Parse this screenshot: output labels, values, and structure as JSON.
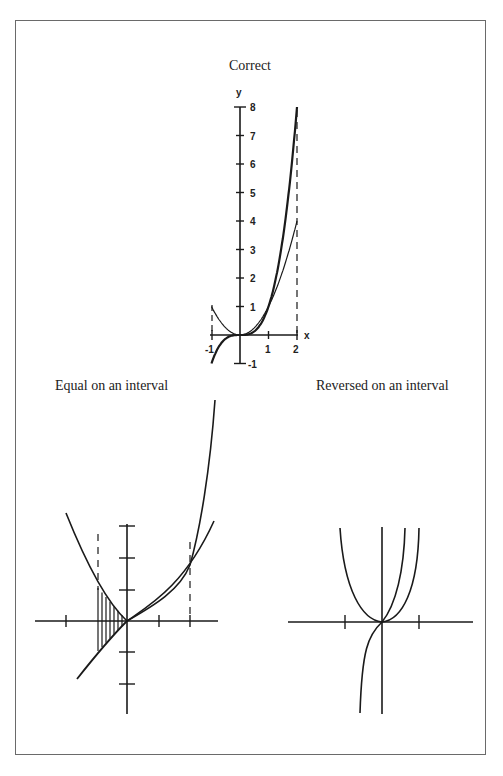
{
  "titles": {
    "top": "Correct",
    "left": "Equal on an interval",
    "right": "Reversed on an interval"
  },
  "colors": {
    "ink": "#1a1a1a",
    "frame": "#6a6a6a",
    "background": "#ffffff"
  },
  "top_plot": {
    "axis_labels": {
      "x": "x",
      "y": "y"
    },
    "x_ticks": [
      "-1",
      "1",
      "2"
    ],
    "y_ticks": [
      "-1",
      "1",
      "2",
      "3",
      "4",
      "5",
      "6",
      "7",
      "8"
    ],
    "curves": [
      {
        "name": "x^3 (bold)",
        "x_range": [
          -1,
          2
        ]
      },
      {
        "name": "x^2 (thin)",
        "x_range": [
          -1,
          2
        ]
      }
    ],
    "dashed_verticals": [
      -1,
      2
    ]
  },
  "left_plot": {
    "description": "Two curves crossing with hatched region between x=-1 and 0",
    "dashed_verticals": [
      "left-bound",
      "right-bound"
    ],
    "hatched_region": "between curves on left interval"
  },
  "right_plot": {
    "description": "Parabola and steep odd-power curve through origin, order reversed on interval"
  }
}
